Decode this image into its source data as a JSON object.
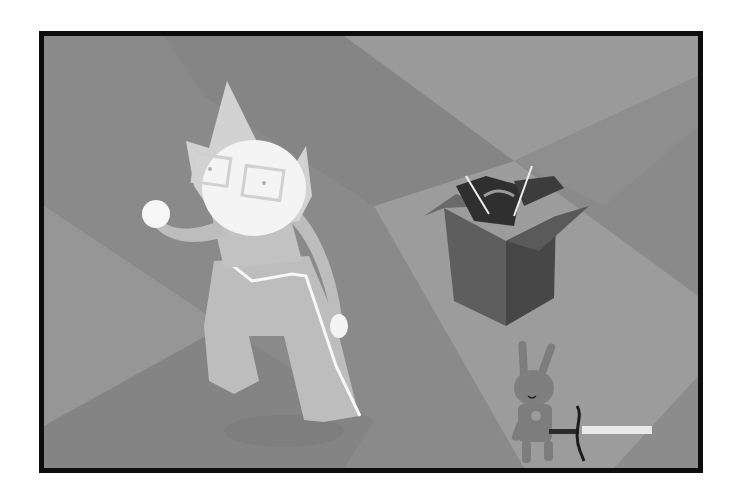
{
  "scene": {
    "alt_text": "Grayscale illustration: a pale cat-eared character with rectangular glasses walks across a diamond-tiled floor; an open cardboard box full of items sits to the right, and a stuffed rabbit holding a glowing sword stands in the lower right.",
    "colors": {
      "frame_border": "#0d0d0d",
      "page_background": "#ffffff",
      "floor_dark": "#848484",
      "floor_light": "#9c9c9c",
      "floor_mid": "#929292",
      "character_skin": "#f4f4f4",
      "character_suit": "#bdbdbd",
      "box_side": "#5e5e5e",
      "box_dark": "#3f3f3f",
      "rabbit": "#7d7d7d",
      "sword_glow": "#f2f2f2"
    },
    "objects": [
      {
        "name": "character",
        "label": "Pale character with cat-ear hood and glasses"
      },
      {
        "name": "box",
        "label": "Open cardboard box with items"
      },
      {
        "name": "rabbit",
        "label": "Stuffed rabbit holding a sword"
      }
    ]
  }
}
